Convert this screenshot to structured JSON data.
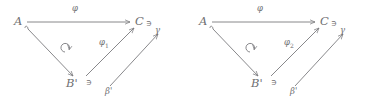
{
  "figure": {
    "type": "commutative-diagram-pair",
    "stroke_color": "#7a7a7e",
    "text_color": "#6f6f72",
    "background": "#ffffff"
  },
  "diagrams": [
    {
      "id": "left",
      "objects": {
        "source": "A",
        "target": "C",
        "intermediate": "B'"
      },
      "membership_symbol_after_target": "∋",
      "membership_symbol_after_intermediate": "∋",
      "arrow_labels": {
        "top": "φ",
        "diagonal_up": "φ₁",
        "diagonal_up_subscript": "1",
        "diagonal_up_base": "φ",
        "right_lower": "γ",
        "bottom": "β'"
      },
      "commutes_marker": "↻"
    },
    {
      "id": "right",
      "objects": {
        "source": "A",
        "target": "C",
        "intermediate": "B'"
      },
      "membership_symbol_after_target": "∋",
      "membership_symbol_after_intermediate": "∋",
      "arrow_labels": {
        "top": "φ",
        "diagonal_up": "φ₂",
        "diagonal_up_subscript": "2",
        "diagonal_up_base": "φ",
        "right_lower": "γ",
        "bottom": "β'"
      },
      "commutes_marker": "↻"
    }
  ]
}
